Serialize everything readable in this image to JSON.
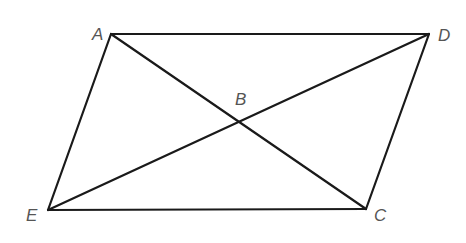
{
  "diagram": {
    "type": "parallelogram-with-diagonals",
    "points": {
      "A": {
        "x": 111,
        "y": 34,
        "label": "A",
        "lx": 92,
        "ly": 40
      },
      "D": {
        "x": 429,
        "y": 34,
        "label": "D",
        "lx": 438,
        "ly": 41
      },
      "C": {
        "x": 366,
        "y": 209,
        "label": "C",
        "lx": 374,
        "ly": 221
      },
      "E": {
        "x": 48,
        "y": 210,
        "label": "E",
        "lx": 26,
        "ly": 221
      },
      "B": {
        "x": 239,
        "y": 122,
        "label": "B",
        "lx": 235,
        "ly": 105
      }
    },
    "segments": [
      [
        "A",
        "D"
      ],
      [
        "D",
        "C"
      ],
      [
        "C",
        "E"
      ],
      [
        "E",
        "A"
      ],
      [
        "A",
        "C"
      ],
      [
        "E",
        "D"
      ]
    ],
    "stroke_color": "#1a1a1a",
    "label_color": "#555555"
  }
}
